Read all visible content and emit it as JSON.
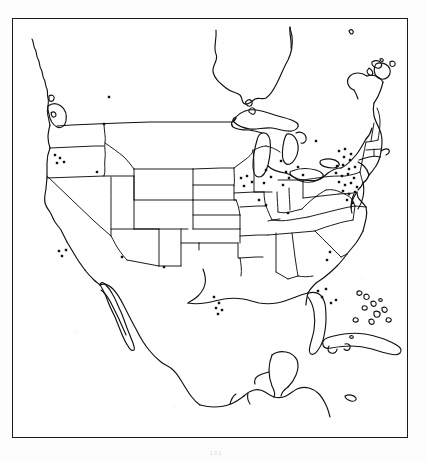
{
  "document": {
    "type": "map",
    "title": "North America outline map with point locations",
    "page_mark": "131"
  },
  "map": {
    "frame": {
      "label": "map-border",
      "color": "#1a1a1a"
    },
    "projection_note": "Conic, contiguous United States centered",
    "line_color": "#111111",
    "fill_color": "#ffffff",
    "background_color": "#ffffff",
    "regions": [
      {
        "name": "United States",
        "shown": true
      },
      {
        "name": "Canada",
        "shown": true
      },
      {
        "name": "Mexico",
        "shown": true
      },
      {
        "name": "Cuba",
        "shown": true
      },
      {
        "name": "Bahamas",
        "shown": true
      },
      {
        "name": "Baja California",
        "shown": true
      },
      {
        "name": "Nova Scotia",
        "shown": true
      },
      {
        "name": "Yucatan Peninsula",
        "shown": true
      },
      {
        "name": "Hudson Bay",
        "shown": true
      },
      {
        "name": "Great Lakes",
        "shown": true
      }
    ]
  },
  "chart_data": {
    "type": "scatter",
    "title": "",
    "xlabel": "",
    "ylabel": "",
    "basemap": "North America outline",
    "marker": {
      "shape": "square-dot",
      "size_px": 2.4,
      "color": "#111111"
    },
    "point_count": 62,
    "clusters": [
      {
        "name": "Northeast corridor",
        "points": 24
      },
      {
        "name": "Midwest",
        "points": 12
      },
      {
        "name": "Pacific Northwest",
        "points": 4
      },
      {
        "name": "Southern California",
        "points": 4
      },
      {
        "name": "Gulf Coast Texas",
        "points": 5
      },
      {
        "name": "Florida",
        "points": 5
      },
      {
        "name": "Northern Plains",
        "points": 2
      },
      {
        "name": "Southwest",
        "points": 3
      },
      {
        "name": "Southeast interior",
        "points": 3
      }
    ],
    "points": [
      [
        109,
        97
      ],
      [
        104,
        124
      ],
      [
        55,
        155
      ],
      [
        60,
        158
      ],
      [
        57,
        163
      ],
      [
        64,
        162
      ],
      [
        97,
        172
      ],
      [
        59,
        251
      ],
      [
        66,
        250
      ],
      [
        62,
        256
      ],
      [
        122,
        257
      ],
      [
        164,
        267
      ],
      [
        214,
        297
      ],
      [
        219,
        303
      ],
      [
        216,
        308
      ],
      [
        222,
        310
      ],
      [
        218,
        314
      ],
      [
        241,
        178
      ],
      [
        247,
        176
      ],
      [
        252,
        182
      ],
      [
        244,
        186
      ],
      [
        266,
        170
      ],
      [
        271,
        177
      ],
      [
        264,
        183
      ],
      [
        281,
        161
      ],
      [
        286,
        172
      ],
      [
        289,
        178
      ],
      [
        283,
        185
      ],
      [
        298,
        167
      ],
      [
        303,
        175
      ],
      [
        259,
        200
      ],
      [
        266,
        205
      ],
      [
        288,
        213
      ],
      [
        316,
        141
      ],
      [
        339,
        151
      ],
      [
        345,
        149
      ],
      [
        351,
        154
      ],
      [
        344,
        157
      ],
      [
        350,
        160
      ],
      [
        337,
        166
      ],
      [
        343,
        165
      ],
      [
        349,
        169
      ],
      [
        355,
        167
      ],
      [
        336,
        173
      ],
      [
        342,
        176
      ],
      [
        348,
        174
      ],
      [
        354,
        178
      ],
      [
        339,
        182
      ],
      [
        345,
        185
      ],
      [
        351,
        183
      ],
      [
        357,
        187
      ],
      [
        343,
        191
      ],
      [
        349,
        194
      ],
      [
        355,
        192
      ],
      [
        347,
        200
      ],
      [
        353,
        203
      ],
      [
        330,
        252
      ],
      [
        327,
        260
      ],
      [
        318,
        291
      ],
      [
        322,
        297
      ],
      [
        326,
        289
      ],
      [
        331,
        303
      ],
      [
        336,
        300
      ]
    ]
  }
}
